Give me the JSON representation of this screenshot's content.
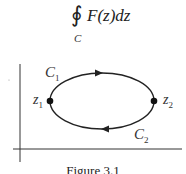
{
  "formula": {
    "integral_symbol": "∮",
    "integrand": "F(z)dz",
    "contour_subscript": "C"
  },
  "diagram": {
    "axes": {
      "horizontal": true,
      "vertical": true
    },
    "contour": {
      "shape": "ellipse",
      "direction": "clockwise",
      "arrows": [
        "top-right",
        "bottom-left"
      ]
    },
    "points": [
      {
        "name": "z1",
        "label": "z",
        "subscript": "1",
        "position": "left"
      },
      {
        "name": "z2",
        "label": "z",
        "subscript": "2",
        "position": "right"
      }
    ],
    "paths": [
      {
        "name": "C1",
        "label": "C",
        "subscript": "1",
        "position": "upper-left"
      },
      {
        "name": "C2",
        "label": "C",
        "subscript": "2",
        "position": "lower-right"
      }
    ]
  },
  "caption": "Figure 3.1",
  "colors": {
    "stroke": "#222222",
    "text": "#333333",
    "background": "#ffffff"
  }
}
